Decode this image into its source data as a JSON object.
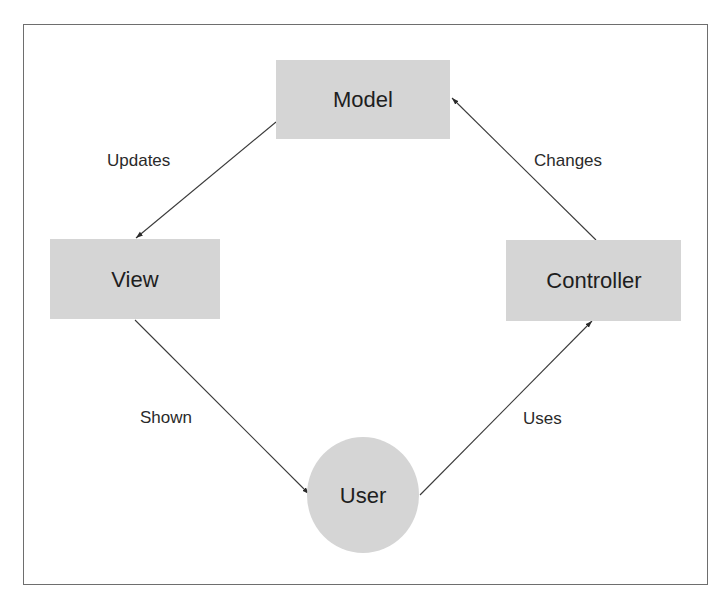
{
  "diagram": {
    "type": "cycle",
    "colors": {
      "node_fill": "#d5d5d5",
      "edge": "#3a3a3a",
      "text": "#1e1e1e",
      "frame": "#6e6e6e",
      "background": "#ffffff"
    },
    "nodes": [
      {
        "id": "model",
        "label": "Model",
        "shape": "rectangle",
        "x": 276,
        "y": 60,
        "w": 174,
        "h": 79,
        "cx": 363,
        "cy": 99
      },
      {
        "id": "view",
        "label": "View",
        "shape": "rectangle",
        "x": 50,
        "y": 239,
        "w": 170,
        "h": 80,
        "cx": 135,
        "cy": 279
      },
      {
        "id": "controller",
        "label": "Controller",
        "shape": "rectangle",
        "x": 506,
        "y": 240,
        "w": 175,
        "h": 81,
        "cx": 594,
        "cy": 280
      },
      {
        "id": "user",
        "label": "User",
        "shape": "ellipse",
        "cx": 363,
        "cy": 495,
        "rx": 56,
        "ry": 58
      }
    ],
    "edges": [
      {
        "id": "updates",
        "from": "model",
        "to": "view",
        "label": "Updates",
        "x1": 276,
        "y1": 122,
        "x2": 136,
        "y2": 238,
        "lx": 107,
        "ly": 166
      },
      {
        "id": "shown",
        "from": "view",
        "to": "user",
        "label": "Shown",
        "x1": 135,
        "y1": 320,
        "x2": 309,
        "y2": 494,
        "lx": 140,
        "ly": 423
      },
      {
        "id": "uses",
        "from": "user",
        "to": "controller",
        "label": "Uses",
        "x1": 420,
        "y1": 495,
        "x2": 592,
        "y2": 321,
        "lx": 523,
        "ly": 424
      },
      {
        "id": "changes",
        "from": "controller",
        "to": "model",
        "label": "Changes",
        "x1": 596,
        "y1": 240,
        "x2": 452,
        "y2": 98,
        "lx": 534,
        "ly": 166
      }
    ]
  }
}
